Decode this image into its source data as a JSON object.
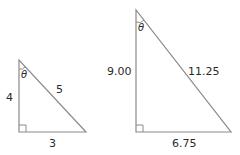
{
  "diagram": {
    "colors": {
      "stroke": "#8a8a8a",
      "text": "#2a2a2a",
      "background": "#ffffff"
    },
    "triangles": [
      {
        "name": "small",
        "vertical_side": "4",
        "hypotenuse": "5",
        "base": "3",
        "angle_label": "θ"
      },
      {
        "name": "large",
        "vertical_side": "9.00",
        "hypotenuse": "11.25",
        "base": "6.75",
        "angle_label": "θ"
      }
    ]
  }
}
